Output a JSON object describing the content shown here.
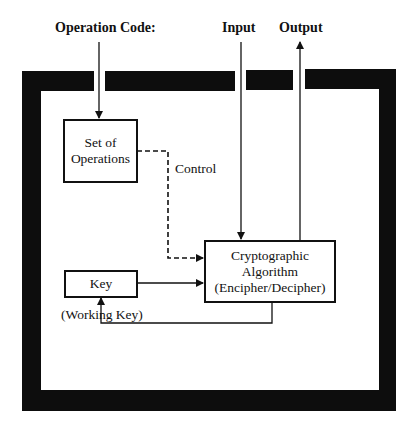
{
  "diagram": {
    "type": "block-diagram",
    "external_labels": {
      "operation_code": "Operation Code:",
      "input": "Input",
      "output": "Output"
    },
    "blocks": {
      "set_of_operations": {
        "line1": "Set of",
        "line2": "Operations"
      },
      "key": {
        "label": "Key"
      },
      "crypto": {
        "line1": "Cryptographic",
        "line2": "Algorithm",
        "line3": "(Encipher/Decipher)"
      }
    },
    "connection_labels": {
      "control": "Control",
      "working_key": "(Working Key)"
    },
    "connections": [
      {
        "from": "Operation Code",
        "to": "Set of Operations",
        "style": "solid"
      },
      {
        "from": "Set of Operations",
        "to": "Cryptographic Algorithm",
        "style": "dashed",
        "label": "Control"
      },
      {
        "from": "Input",
        "to": "Cryptographic Algorithm",
        "style": "solid"
      },
      {
        "from": "Cryptographic Algorithm",
        "to": "Output",
        "style": "solid"
      },
      {
        "from": "Key",
        "to": "Cryptographic Algorithm",
        "style": "solid"
      },
      {
        "from": "Cryptographic Algorithm",
        "to": "Key",
        "style": "solid",
        "label": "(Working Key)"
      }
    ],
    "colors": {
      "frame": "#0d0d0d",
      "line": "#111111",
      "background": "#ffffff"
    }
  }
}
